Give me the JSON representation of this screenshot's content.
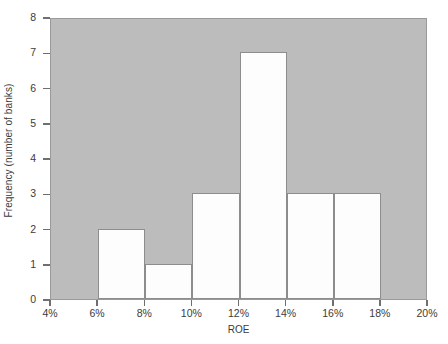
{
  "chart_data": {
    "type": "bar",
    "title": "",
    "subtitle": "",
    "xlabel": "ROE",
    "ylabel": "Frequency (number of banks)",
    "categories": [
      "4%–6%",
      "6%–8%",
      "8%–10%",
      "10%–12%",
      "12%–14%",
      "14%–16%",
      "16%–18%",
      "18%–20%"
    ],
    "values": [
      0,
      2,
      1,
      3,
      7,
      3,
      3,
      0
    ],
    "bin_edges": [
      4,
      6,
      8,
      10,
      12,
      14,
      16,
      18,
      20
    ],
    "xtick_labels": [
      "4%",
      "6%",
      "8%",
      "10%",
      "12%",
      "14%",
      "16%",
      "18%",
      "20%"
    ],
    "ytick_labels": [
      "0",
      "1",
      "2",
      "3",
      "4",
      "5",
      "6",
      "7",
      "8"
    ],
    "ytick_values": [
      0,
      1,
      2,
      3,
      4,
      5,
      6,
      7,
      8
    ],
    "xlim": [
      4,
      20
    ],
    "ylim": [
      0,
      8
    ],
    "grid": false,
    "legend": null,
    "annotations": [],
    "colors": {
      "plot_background": "#bcbcbc",
      "bar_fill": "#fdfdfd",
      "bar_edge": "#8d8d8d",
      "axis": "#6f6f6f",
      "text": "#3b3b3b",
      "figure_background": "#ffffff"
    }
  }
}
